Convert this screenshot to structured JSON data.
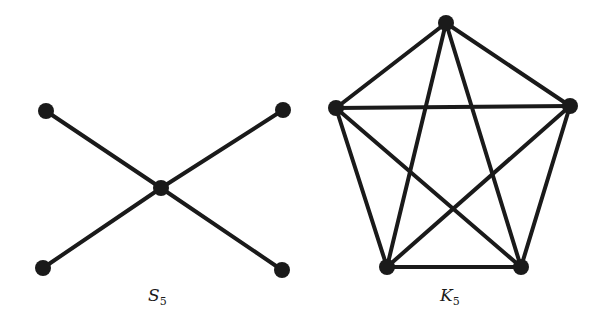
{
  "graphs": [
    {
      "name": "S",
      "subscript": "5",
      "label_pos": [
        148,
        285
      ],
      "vertices": [
        [
          46,
          111
        ],
        [
          283,
          110
        ],
        [
          161,
          188
        ],
        [
          43,
          268
        ],
        [
          282,
          270
        ]
      ],
      "edges": [
        [
          0,
          2
        ],
        [
          1,
          2
        ],
        [
          3,
          2
        ],
        [
          4,
          2
        ]
      ]
    },
    {
      "name": "K",
      "subscript": "5",
      "label_pos": [
        440,
        285
      ],
      "vertices": [
        [
          446,
          23
        ],
        [
          336,
          108
        ],
        [
          570,
          106
        ],
        [
          387,
          267
        ],
        [
          521,
          267
        ]
      ],
      "edges": [
        [
          0,
          1
        ],
        [
          0,
          2
        ],
        [
          0,
          3
        ],
        [
          0,
          4
        ],
        [
          1,
          2
        ],
        [
          1,
          3
        ],
        [
          1,
          4
        ],
        [
          2,
          3
        ],
        [
          2,
          4
        ],
        [
          3,
          4
        ]
      ]
    }
  ],
  "colors": {
    "ink": "#1a1a1a",
    "background": "#ffffff"
  }
}
